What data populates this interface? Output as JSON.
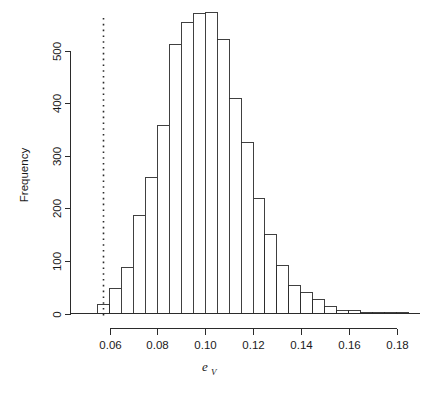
{
  "figure": {
    "background": "#ffffff",
    "ink_color": "#2b2b2b",
    "width": 429,
    "height": 398
  },
  "labels": {
    "ylabel": "Frequency",
    "xlabel_base": "e",
    "xlabel_sub": "V"
  },
  "chart_data": {
    "type": "bar",
    "title": "",
    "subtitle": "",
    "xlabel": "e_V",
    "ylabel": "Frequency",
    "xlim": [
      0.0536,
      0.1855
    ],
    "ylim": [
      0,
      580
    ],
    "grid": false,
    "legend": null,
    "bin_width": 0.005,
    "xticks": [
      0.06,
      0.08,
      0.1,
      0.12,
      0.14,
      0.16,
      0.18
    ],
    "xtick_labels": [
      "0.06",
      "0.08",
      "0.10",
      "0.12",
      "0.14",
      "0.16",
      "0.18"
    ],
    "yticks": [
      0,
      100,
      200,
      300,
      400,
      500
    ],
    "ytick_labels": [
      "0",
      "100",
      "200",
      "300",
      "400",
      "500"
    ],
    "bin_edges": [
      0.055,
      0.06,
      0.065,
      0.07,
      0.075,
      0.08,
      0.085,
      0.09,
      0.095,
      0.1,
      0.105,
      0.11,
      0.115,
      0.12,
      0.125,
      0.13,
      0.135,
      0.14,
      0.145,
      0.15,
      0.155,
      0.16,
      0.165,
      0.17,
      0.175,
      0.18,
      0.185
    ],
    "categories": [
      "0.055-0.060",
      "0.060-0.065",
      "0.065-0.070",
      "0.070-0.075",
      "0.075-0.080",
      "0.080-0.085",
      "0.085-0.090",
      "0.090-0.095",
      "0.095-0.100",
      "0.100-0.105",
      "0.105-0.110",
      "0.110-0.115",
      "0.115-0.120",
      "0.120-0.125",
      "0.125-0.130",
      "0.130-0.135",
      "0.135-0.140",
      "0.140-0.145",
      "0.145-0.150",
      "0.150-0.155",
      "0.155-0.160",
      "0.160-0.165",
      "0.165-0.170",
      "0.170-0.175",
      "0.175-0.180",
      "0.180-0.185"
    ],
    "values": [
      18,
      48,
      88,
      187,
      258,
      357,
      511,
      553,
      570,
      573,
      520,
      408,
      325,
      219,
      151,
      91,
      53,
      40,
      26,
      14,
      6,
      6,
      1,
      1,
      1,
      1
    ],
    "annotations": [
      {
        "name": "observed-value-line",
        "type": "vline",
        "x": 0.0574,
        "style": "dotted",
        "label": ""
      }
    ]
  }
}
